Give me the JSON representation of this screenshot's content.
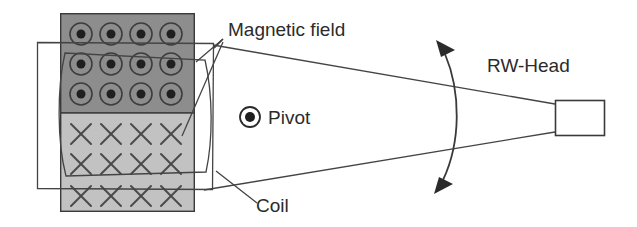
{
  "diagram": {
    "labels": {
      "magnetic_field": "Magnetic field",
      "pivot": "Pivot",
      "coil": "Coil",
      "rw_head": "RW-Head"
    },
    "colors": {
      "background": "#ffffff",
      "magnet_north_fill": "#8d8d8d",
      "magnet_south_fill": "#c2c2c2",
      "outline": "#3a3a3a",
      "text": "#2b2b2b",
      "symbol": "#3d3d3d"
    },
    "magnet_block": {
      "x": 60,
      "y": 13,
      "width": 135,
      "height": 199,
      "divider_y": 113,
      "north_region_label": "field out of plane (dots)",
      "south_region_label": "field into plane (crosses)"
    },
    "field_symbols": {
      "dot_symbol_name": "field-out-of-page",
      "cross_symbol_name": "field-into-page",
      "dot_columns_x": [
        81,
        111,
        141,
        171
      ],
      "dot_rows_y": [
        34,
        64,
        94
      ],
      "cross_columns_x": [
        81,
        111,
        141,
        171
      ],
      "cross_rows_y": [
        134,
        164,
        196
      ],
      "dot_outer_radius": 11,
      "dot_inner_radius": 4.5,
      "cross_half_size": 11
    },
    "coil": {
      "outer_rect": {
        "x": 37,
        "y": 42,
        "width": 176,
        "height": 148
      },
      "inner_loop": {
        "x": 52,
        "y": 52,
        "width": 160,
        "height": 124
      }
    },
    "pivot_legend": {
      "center_x": 250,
      "center_y": 117,
      "outer_radius": 10,
      "inner_radius": 5,
      "text_x": 268,
      "text_y": 124
    },
    "rw_head": {
      "rect": {
        "x": 555,
        "y": 100,
        "width": 50,
        "height": 36
      },
      "text_x": 487,
      "text_y": 72
    },
    "swing_arc": {
      "top_arrow_x": 443,
      "top_arrow_y": 44,
      "bottom_arrow_x": 440,
      "bottom_arrow_y": 188,
      "bulge_x": 461
    },
    "cone": {
      "apex_x": 555,
      "apex_top_y": 104,
      "apex_bottom_y": 132,
      "left_top": {
        "x": 213,
        "y": 45
      },
      "left_bottom": {
        "x": 204,
        "y": 190
      }
    },
    "leaders": {
      "magnetic_field_label_x": 228,
      "magnetic_field_label_y": 36,
      "coil_label_x": 256,
      "coil_label_y": 212
    }
  }
}
